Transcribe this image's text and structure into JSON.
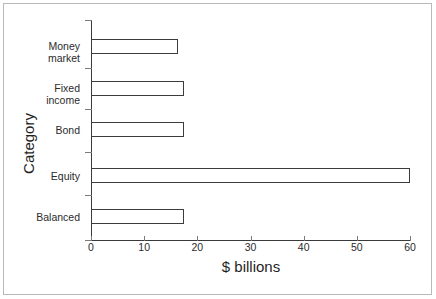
{
  "chart_data": {
    "type": "bar",
    "orientation": "horizontal",
    "title": "",
    "xlabel": "$ billions",
    "ylabel": "Category",
    "categories": [
      "Money market",
      "Fixed income",
      "Bond",
      "Equity",
      "Balanced"
    ],
    "category_lines": [
      [
        "Money",
        "market"
      ],
      [
        "Fixed",
        "income"
      ],
      [
        "Bond"
      ],
      [
        "Equity"
      ],
      [
        "Balanced"
      ]
    ],
    "values": [
      16.4,
      17.5,
      17.5,
      60.0,
      17.5
    ],
    "xlim": [
      0,
      60
    ],
    "xticks": [
      0,
      10,
      20,
      30,
      40,
      50,
      60
    ],
    "xticklabels": [
      "0",
      "10",
      "20",
      "30",
      "40",
      "50",
      "60"
    ],
    "grid": false,
    "legend": false,
    "bar_facecolor": "#ffffff",
    "bar_edgecolor": "#3c3c3c",
    "axis_color": "#3a3a3a",
    "text_color": "#1f1f1f",
    "frame_color": "#b9b9b9",
    "background": "#ffffff"
  }
}
